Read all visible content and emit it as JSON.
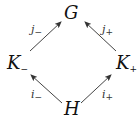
{
  "diagram": {
    "type": "commutative-diagram",
    "nodes": {
      "top": {
        "label": "G"
      },
      "left": {
        "label": "K",
        "sub": "−"
      },
      "right": {
        "label": "K",
        "sub": "+"
      },
      "bottom": {
        "label": "H"
      }
    },
    "edges": [
      {
        "from": "left",
        "to": "top",
        "label": "j",
        "sub": "−"
      },
      {
        "from": "right",
        "to": "top",
        "label": "j",
        "sub": "+"
      },
      {
        "from": "bottom",
        "to": "left",
        "label": "i",
        "sub": "−"
      },
      {
        "from": "bottom",
        "to": "right",
        "label": "i",
        "sub": "+"
      }
    ]
  }
}
